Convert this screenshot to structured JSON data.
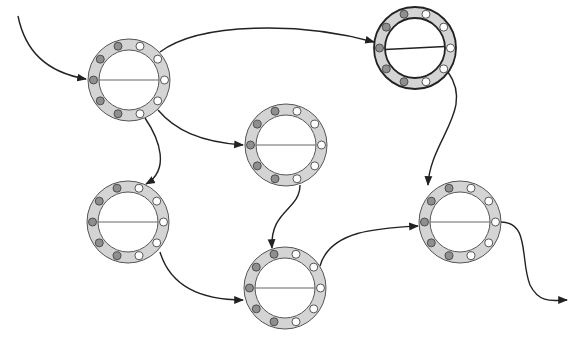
{
  "diagram": {
    "width": 584,
    "height": 347,
    "colors": {
      "background": "#ffffff",
      "ring_fill": "#d4d4d4",
      "ring_stroke": "#555555",
      "ring_stroke_highlight": "#222222",
      "dot_filled": "#8f8f8f",
      "dot_empty": "#ffffff",
      "dot_stroke": "#444444",
      "edge": "#222222"
    },
    "ring_geometry": {
      "outer_radius": 41,
      "inner_radius": 30,
      "dot_radius": 4,
      "dot_orbit": 35.5,
      "dot_count": 10
    },
    "nodes": [
      {
        "id": "node-1",
        "cx": 129,
        "cy": 80,
        "highlight": false,
        "line_tilt": 0
      },
      {
        "id": "node-2",
        "cx": 415,
        "cy": 48,
        "highlight": true,
        "line_tilt": -3
      },
      {
        "id": "node-3",
        "cx": 286,
        "cy": 145,
        "highlight": false,
        "line_tilt": 0
      },
      {
        "id": "node-4",
        "cx": 128,
        "cy": 222,
        "highlight": false,
        "line_tilt": 0
      },
      {
        "id": "node-5",
        "cx": 285,
        "cy": 288,
        "highlight": false,
        "line_tilt": 0
      },
      {
        "id": "node-6",
        "cx": 460,
        "cy": 222,
        "highlight": false,
        "line_tilt": 0
      }
    ],
    "edges": [
      {
        "id": "edge-input",
        "from": "start",
        "to": "node-1",
        "path": "M 18 16 C 25 50, 45 72, 86 79",
        "arrow": true
      },
      {
        "id": "edge-1-2",
        "from": "node-1",
        "to": "node-2",
        "path": "M 160 52 C 200 22, 300 22, 374 42",
        "arrow": true
      },
      {
        "id": "edge-1-3",
        "from": "node-1",
        "to": "node-3",
        "path": "M 158 110 C 175 130, 200 142, 243 145",
        "arrow": true
      },
      {
        "id": "edge-1-4",
        "from": "node-1",
        "to": "node-4",
        "path": "M 145 118 C 160 140, 170 170, 146 184",
        "arrow": true
      },
      {
        "id": "edge-3-5",
        "from": "node-3",
        "to": "node-5",
        "path": "M 300 185 C 300 210, 270 210, 272 248",
        "arrow": true
      },
      {
        "id": "edge-4-5",
        "from": "node-4",
        "to": "node-5",
        "path": "M 160 252 C 170 285, 200 300, 243 300",
        "arrow": true
      },
      {
        "id": "edge-2-6",
        "from": "node-2",
        "to": "node-6",
        "path": "M 448 72 C 475 110, 430 140, 428 185",
        "arrow": true
      },
      {
        "id": "edge-5-6",
        "from": "node-5",
        "to": "node-6",
        "path": "M 320 266 C 330 230, 380 228, 418 226",
        "arrow": true
      },
      {
        "id": "edge-output",
        "from": "node-6",
        "to": "end",
        "path": "M 501 222 C 530 222, 520 260, 530 285 C 540 305, 555 300, 567 300",
        "arrow": true
      }
    ]
  }
}
